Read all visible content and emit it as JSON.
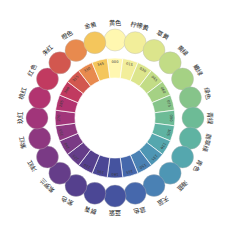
{
  "figure": {
    "type": "color-wheel",
    "title": "",
    "segments_count": 24,
    "hue_step_degrees": 15,
    "inner_radius": 40,
    "outer_radius": 60,
    "dot_radius": 11,
    "dot_orbit_radius": 78,
    "center_x": 115,
    "center_y": 118,
    "background": "#ffffff",
    "ring_divider_color": "#ffffff",
    "dot_stroke_color": "#b9b9b9"
  },
  "chart_data": {
    "type": "pie",
    "title": "",
    "xlabel": "",
    "ylabel": "",
    "legend_position": "radial-outside",
    "categories": [
      "000",
      "015",
      "030",
      "045",
      "060",
      "075",
      "090",
      "105",
      "120",
      "135",
      "150",
      "165",
      "180",
      "195",
      "210",
      "225",
      "240",
      "255",
      "270",
      "285",
      "300",
      "315",
      "330",
      "345"
    ],
    "values": [
      15,
      15,
      15,
      15,
      15,
      15,
      15,
      15,
      15,
      15,
      15,
      15,
      15,
      15,
      15,
      15,
      15,
      15,
      15,
      15,
      15,
      15,
      15,
      15
    ],
    "series": [
      {
        "name": "hue",
        "values": [
          0,
          15,
          30,
          45,
          60,
          75,
          90,
          105,
          120,
          135,
          150,
          165,
          180,
          195,
          210,
          225,
          240,
          255,
          270,
          285,
          300,
          315,
          330,
          345
        ]
      }
    ],
    "entries": [
      {
        "deg": "000",
        "name": "黄色",
        "color": "#FFF7B0",
        "angle": 0
      },
      {
        "deg": "015",
        "name": "柠檬黄",
        "color": "#F2EE9A",
        "angle": 15
      },
      {
        "deg": "030",
        "name": "草黄",
        "color": "#DCE58C",
        "angle": 30
      },
      {
        "deg": "045",
        "name": "黄绿",
        "color": "#C2DC86",
        "angle": 45
      },
      {
        "deg": "060",
        "name": "嫩绿",
        "color": "#A5D184",
        "angle": 60
      },
      {
        "deg": "075",
        "name": "绿色",
        "color": "#86C48A",
        "angle": 75
      },
      {
        "deg": "090",
        "name": "青绿",
        "color": "#6DBB96",
        "angle": 90
      },
      {
        "deg": "105",
        "name": "翡翠绿",
        "color": "#5FB3A2",
        "angle": 105
      },
      {
        "deg": "120",
        "name": "青色",
        "color": "#55A7AE",
        "angle": 120
      },
      {
        "deg": "135",
        "name": "海蓝",
        "color": "#4E96B4",
        "angle": 135
      },
      {
        "deg": "150",
        "name": "天蓝",
        "color": "#4A81B4",
        "angle": 150
      },
      {
        "deg": "165",
        "name": "蓝色",
        "color": "#4668AC",
        "angle": 165
      },
      {
        "deg": "180",
        "name": "蓝紫",
        "color": "#45539F",
        "angle": 180
      },
      {
        "deg": "195",
        "name": "群青",
        "color": "#4B4795",
        "angle": 195
      },
      {
        "deg": "210",
        "name": "紫色",
        "color": "#55408D",
        "angle": 210
      },
      {
        "deg": "225",
        "name": "紫罗兰",
        "color": "#653D89",
        "angle": 225
      },
      {
        "deg": "240",
        "name": "洋红",
        "color": "#7A3A85",
        "angle": 240
      },
      {
        "deg": "255",
        "name": "紫红",
        "color": "#8E3880",
        "angle": 255
      },
      {
        "deg": "270",
        "name": "玖红",
        "color": "#A1357A",
        "angle": 270
      },
      {
        "deg": "285",
        "name": "桃红",
        "color": "#B23470",
        "angle": 285
      },
      {
        "deg": "300",
        "name": "红色",
        "color": "#C13A60",
        "angle": 300
      },
      {
        "deg": "315",
        "name": "朱红",
        "color": "#D2574F",
        "angle": 315
      },
      {
        "deg": "330",
        "name": "橙色",
        "color": "#E88A4E",
        "angle": 330
      },
      {
        "deg": "345",
        "name": "金黄",
        "color": "#F4C65C",
        "angle": 345
      }
    ]
  }
}
